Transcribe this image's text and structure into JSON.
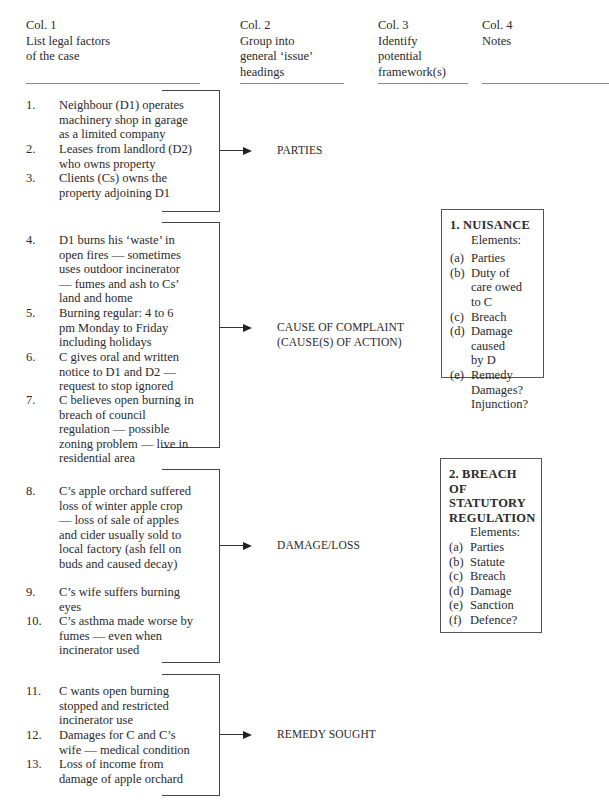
{
  "columns": [
    {
      "label": "Col. 1",
      "description": [
        "List legal factors",
        "of the case"
      ]
    },
    {
      "label": "Col. 2",
      "description": [
        "Group into",
        "general ‘issue’",
        "headings"
      ]
    },
    {
      "label": "Col. 3",
      "description": [
        "Identify",
        "potential",
        "framework(s)"
      ]
    },
    {
      "label": "Col. 4",
      "description": [
        "Notes"
      ]
    }
  ],
  "groups": [
    {
      "issue": [
        "PARTIES"
      ],
      "factors": [
        {
          "num": "1.",
          "text": "Neighbour (D1) operates machinery shop in garage as a limited company"
        },
        {
          "num": "2.",
          "text": "Leases from landlord (D2) who owns property"
        },
        {
          "num": "3.",
          "text": "Clients (Cs) owns the property adjoining D1"
        }
      ]
    },
    {
      "issue": [
        "CAUSE OF COMPLAINT",
        "(CAUSE(S) OF ACTION)"
      ],
      "factors": [
        {
          "num": "4.",
          "text": "D1 burns his ‘waste’ in open fires — sometimes uses outdoor incinerator — fumes and ash to Cs’ land and home"
        },
        {
          "num": "5.",
          "text": "Burning regular: 4 to 6 pm Monday to Friday including holidays"
        },
        {
          "num": "6.",
          "text": "C gives oral and written notice to D1 and D2 — request to stop ignored"
        },
        {
          "num": "7.",
          "text": "C believes open burning in breach of council regulation — possible zoning problem — live in residential area"
        }
      ]
    },
    {
      "issue": [
        "DAMAGE/LOSS"
      ],
      "factors": [
        {
          "num": "8.",
          "text": "C’s apple orchard suffered loss of winter apple crop — loss of sale of apples and cider usually sold to local factory (ash fell on buds and caused decay)"
        },
        {
          "num": "9.",
          "text": "C’s wife suffers burning eyes"
        },
        {
          "num": "10.",
          "text": "C’s asthma made worse by fumes — even when incinerator used"
        }
      ]
    },
    {
      "issue": [
        "REMEDY SOUGHT"
      ],
      "factors": [
        {
          "num": "11.",
          "text": "C wants open burning stopped and restricted incinerator use"
        },
        {
          "num": "12.",
          "text": "Damages for C and C’s wife — medical condition"
        },
        {
          "num": "13.",
          "text": "Loss of income from damage of apple orchard"
        }
      ]
    }
  ],
  "frameworks": [
    {
      "title": [
        "1. NUISANCE"
      ],
      "elements_label": "Elements:",
      "elements": [
        {
          "label": "(a)",
          "text": [
            "Parties"
          ]
        },
        {
          "label": "(b)",
          "text": [
            "Duty of",
            "care owed",
            "to C"
          ]
        },
        {
          "label": "(c)",
          "text": [
            "Breach"
          ]
        },
        {
          "label": "(d)",
          "text": [
            "Damage",
            "caused",
            "by D"
          ]
        },
        {
          "label": "(e)",
          "text": [
            "Remedy",
            "Damages?",
            "Injunction?"
          ]
        }
      ]
    },
    {
      "title": [
        "2. BREACH",
        "OF",
        "STATUTORY",
        "REGULATION"
      ],
      "elements_label": "Elements:",
      "elements": [
        {
          "label": "(a)",
          "text": [
            "Parties"
          ]
        },
        {
          "label": "(b)",
          "text": [
            "Statute"
          ]
        },
        {
          "label": "(c)",
          "text": [
            "Breach"
          ]
        },
        {
          "label": "(d)",
          "text": [
            "Damage"
          ]
        },
        {
          "label": "(e)",
          "text": [
            "Sanction"
          ]
        },
        {
          "label": "(f)",
          "text": [
            "Defence?"
          ]
        }
      ]
    }
  ],
  "colors": {
    "text": "#2a2a2a",
    "lines": "#444444",
    "rule": "#8a8a8a"
  }
}
